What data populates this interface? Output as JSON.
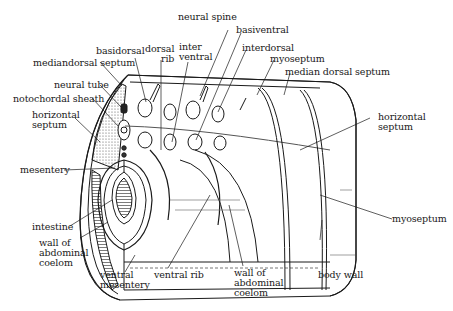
{
  "diagram": {
    "colors": {
      "ink": "#1a1a1a",
      "paper": "#ffffff",
      "shade": "#6e6e6e"
    },
    "labels": {
      "neural_spine": "neural spine",
      "basidorsal": "basidorsal",
      "dorsal_rib": "dorsal\nrib",
      "interventral": "inter\nventral",
      "basiventral": "basiventral",
      "interdorsal": "interdorsal",
      "myoseptum_top": "myoseptum",
      "median_dorsal_septum": "median dorsal septum",
      "mediandorsal_septum": "mediandorsal septum",
      "neural_tube": "neural tube",
      "notochordal_sheath": "notochordal sheath",
      "horizontal_septum_left": "horizontal\nseptum",
      "horizontal_septum_right": "horizontal\nseptum",
      "mesentery": "mesentery",
      "intestine": "intestine",
      "wall_of_abdominal_coelom_left": "wall of\nabdominal\ncoelom",
      "ventral_mesentery": "ventral\nmesentery",
      "ventral_rib": "ventral rib",
      "wall_of_abdominal_coelom_right": "wall of\nabdominal\ncoelom",
      "body_wall": "body wall",
      "myoseptum_right": "myoseptum"
    }
  }
}
